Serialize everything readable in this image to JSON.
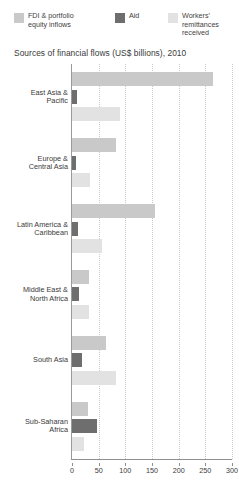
{
  "legend": {
    "items": [
      {
        "label": "FDI & portfolio\nequity inflows",
        "color": "#c9c9c9",
        "icon": "legend-swatch-icon"
      },
      {
        "label": "Aid",
        "color": "#6e6e6e",
        "icon": "legend-swatch-icon"
      },
      {
        "label": "Workers'\nremittances\nreceived",
        "color": "#e2e2e2",
        "icon": "legend-swatch-icon"
      }
    ]
  },
  "chart_data": {
    "type": "bar",
    "orientation": "horizontal",
    "title": "Sources of financial flows (US$ billions), 2010",
    "xlabel": "",
    "ylabel": "",
    "xlim": [
      0,
      300
    ],
    "xticks": [
      0,
      50,
      100,
      150,
      200,
      250,
      300
    ],
    "grid": true,
    "legend_position": "top",
    "categories": [
      "East Asia &\nPacific",
      "Europe &\nCentral Asia",
      "Latin America &\nCaribbean",
      "Middle East &\nNorth Africa",
      "South Asia",
      "Sub-Saharan\nAfrica"
    ],
    "series": [
      {
        "name": "FDI & portfolio equity inflows",
        "color": "#c9c9c9",
        "values": [
          265,
          82,
          155,
          31,
          64,
          30
        ]
      },
      {
        "name": "Aid",
        "color": "#6e6e6e",
        "values": [
          9,
          8,
          11,
          14,
          18,
          46
        ]
      },
      {
        "name": "Workers' remittances received",
        "color": "#e2e2e2",
        "values": [
          90,
          33,
          57,
          31,
          82,
          22
        ]
      }
    ]
  }
}
